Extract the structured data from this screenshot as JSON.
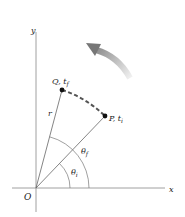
{
  "diagram": {
    "axes": {
      "x_label": "x",
      "y_label": "y",
      "origin_label": "O"
    },
    "points": [
      {
        "id": "Q",
        "label": "Q",
        "time_label": "t",
        "time_sub": "f",
        "separator": ", "
      },
      {
        "id": "P",
        "label": "P",
        "time_label": "t",
        "time_sub": "i",
        "separator": ", "
      }
    ],
    "radius_label": "r",
    "angles": {
      "theta_f": {
        "symbol": "θ",
        "sub": "f"
      },
      "theta_i": {
        "symbol": "θ",
        "sub": "i"
      }
    },
    "path_style": "dashed-arc",
    "rotation_direction": "counterclockwise",
    "colors": {
      "lines": "#555555",
      "path": "#555555",
      "arrow_dark": "#777777",
      "arrow_light": "#e6e6e6",
      "points": "#111111"
    }
  }
}
